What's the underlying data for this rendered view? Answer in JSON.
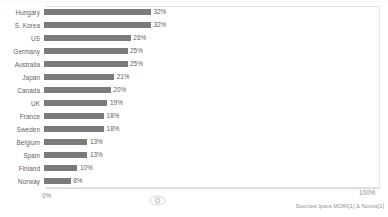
{
  "chart_data": {
    "type": "bar",
    "orientation": "horizontal",
    "title": "",
    "subtitle": "",
    "xlabel": "",
    "ylabel": "",
    "xlim": [
      0,
      100
    ],
    "grid": false,
    "legend": false,
    "bar_color": "#7b7b7b",
    "categories": [
      "Hungary",
      "S. Korea",
      "US",
      "Germany",
      "Australia",
      "Japan",
      "Canada",
      "UK",
      "France",
      "Sweden",
      "Belgium",
      "Spain",
      "Finland",
      "Norway"
    ],
    "values": [
      32,
      32,
      26,
      25,
      25,
      21,
      20,
      19,
      18,
      18,
      13,
      13,
      10,
      8
    ],
    "value_labels": [
      "32%",
      "32%",
      "26%",
      "25%",
      "25%",
      "21%",
      "20%",
      "19%",
      "18%",
      "18%",
      "13%",
      "13%",
      "10%",
      "8%"
    ],
    "axis_ticks": [
      "0%",
      "100%"
    ],
    "axis_tick_values": [
      0,
      100
    ]
  },
  "axis": {
    "min_label": "0%",
    "max_label": "100%"
  },
  "footer": {
    "source": "Sources Ipsos MORI[1] & Novus[1]"
  },
  "icons": {
    "watermark": "eye-icon"
  }
}
